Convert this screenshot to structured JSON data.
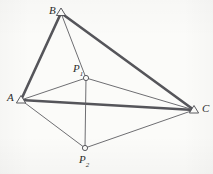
{
  "figure": {
    "type": "geometric-diagram",
    "width": 213,
    "height": 174,
    "background_color": "#fbfbf9",
    "stroke_color": "#4a4a4f",
    "label_color": "#2c2c2c",
    "vertices": [
      {
        "id": "B",
        "label": "B",
        "subscript": "",
        "x": 61,
        "y": 13,
        "marker": "triangle-outline",
        "label_x": 49,
        "label_y": 6
      },
      {
        "id": "A",
        "label": "A",
        "subscript": "",
        "x": 21,
        "y": 100,
        "marker": "triangle-outline",
        "label_x": 7,
        "label_y": 93
      },
      {
        "id": "C",
        "label": "C",
        "subscript": "",
        "x": 194,
        "y": 110,
        "marker": "triangle-outline",
        "label_x": 202,
        "label_y": 104
      },
      {
        "id": "P1",
        "label": "P",
        "subscript": "1",
        "x": 86,
        "y": 78,
        "marker": "circle-outline",
        "label_x": 72,
        "label_y": 64
      },
      {
        "id": "P2",
        "label": "P",
        "subscript": "2",
        "x": 85,
        "y": 148,
        "marker": "circle-outline",
        "label_x": 79,
        "label_y": 155
      }
    ],
    "edges": [
      {
        "id": "AB",
        "from": "A",
        "to": "B",
        "weight": "thick"
      },
      {
        "id": "BC",
        "from": "B",
        "to": "C",
        "weight": "thick"
      },
      {
        "id": "AC",
        "from": "A",
        "to": "C",
        "weight": "thick"
      },
      {
        "id": "BP1",
        "from": "B",
        "to": "P1",
        "weight": "thin"
      },
      {
        "id": "AP1",
        "from": "A",
        "to": "P1",
        "weight": "thin"
      },
      {
        "id": "P1C",
        "from": "P1",
        "to": "C",
        "weight": "thin"
      },
      {
        "id": "P1P2",
        "from": "P1",
        "to": "P2",
        "weight": "thin"
      },
      {
        "id": "AP2",
        "from": "A",
        "to": "P2",
        "weight": "thin"
      },
      {
        "id": "P2C",
        "from": "P2",
        "to": "C",
        "weight": "thin"
      }
    ]
  }
}
